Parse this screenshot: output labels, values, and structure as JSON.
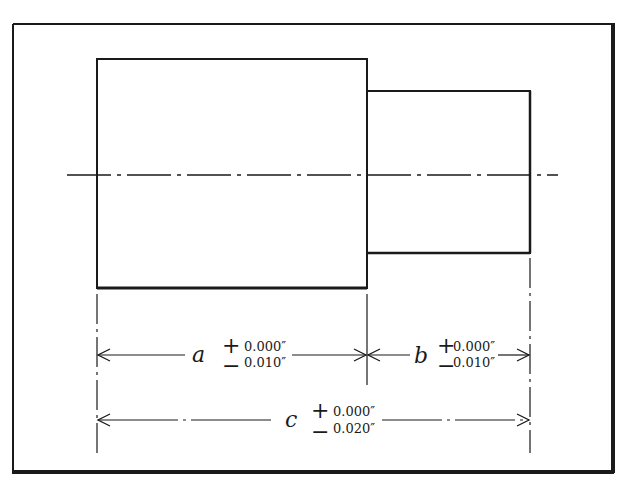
{
  "diagram": {
    "type": "stepped-shaft-dimensioning",
    "colors": {
      "line": "#1a1a1a",
      "background": "#ffffff"
    },
    "frame": {
      "x": 13,
      "y": 24,
      "width": 600,
      "height": 448
    },
    "large_cylinder": {
      "x": 97,
      "y": 59,
      "width": 270,
      "height": 229
    },
    "small_cylinder": {
      "x": 367,
      "y": 91,
      "width": 163,
      "height": 162
    },
    "centerline": {
      "y": 175,
      "x1": 67,
      "x2": 558
    },
    "dimensions": [
      {
        "id": "a",
        "variable": "a",
        "plus_sign": "+",
        "minus_sign": "−",
        "plus_tol": "0.000″",
        "minus_tol": "0.010″",
        "from_x": 97,
        "to_x": 367,
        "y": 355
      },
      {
        "id": "b",
        "variable": "b",
        "plus_sign": "+",
        "minus_sign": "−",
        "plus_tol": "0.000″",
        "minus_tol": "0.010″",
        "from_x": 367,
        "to_x": 530,
        "y": 355
      },
      {
        "id": "c",
        "variable": "c",
        "plus_sign": "+",
        "minus_sign": "−",
        "plus_tol": "0.000″",
        "minus_tol": "0.020″",
        "from_x": 97,
        "to_x": 530,
        "y": 420
      }
    ]
  }
}
